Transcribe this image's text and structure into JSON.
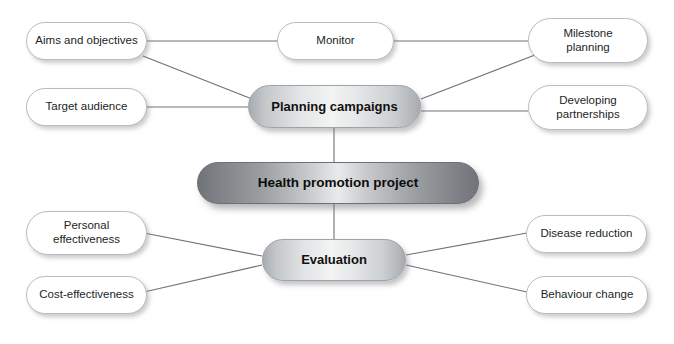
{
  "diagram": {
    "type": "mind-map",
    "background_color": "#ffffff",
    "line_color": "#6e7276",
    "center": {
      "id": "health-promotion-project",
      "label": "Health promotion project",
      "x": 197,
      "y": 162,
      "w": 282,
      "h": 42,
      "style": "center"
    },
    "branches": [
      {
        "id": "planning-campaigns",
        "label": "Planning campaigns",
        "x": 248,
        "y": 85,
        "w": 173,
        "h": 43,
        "style": "mid"
      },
      {
        "id": "evaluation",
        "label": "Evaluation",
        "x": 262,
        "y": 239,
        "w": 144,
        "h": 42,
        "style": "mid"
      }
    ],
    "leaves": [
      {
        "id": "aims-and-objectives",
        "label": "Aims and objectives",
        "lines": [
          "Aims and objectives"
        ],
        "x": 26,
        "y": 22,
        "w": 121,
        "h": 38,
        "parent": "planning-campaigns"
      },
      {
        "id": "monitor",
        "label": "Monitor",
        "lines": [
          "Monitor"
        ],
        "x": 277,
        "y": 22,
        "w": 117,
        "h": 38,
        "parent": "planning-campaigns"
      },
      {
        "id": "milestone-planning",
        "label": "Milestone planning",
        "lines": [
          "Milestone",
          "planning"
        ],
        "x": 528,
        "y": 18,
        "w": 120,
        "h": 45,
        "parent": "planning-campaigns"
      },
      {
        "id": "target-audience",
        "label": "Target audience",
        "lines": [
          "Target audience"
        ],
        "x": 26,
        "y": 88,
        "w": 121,
        "h": 38,
        "parent": "planning-campaigns"
      },
      {
        "id": "developing-partnerships",
        "label": "Developing partnerships",
        "lines": [
          "Developing",
          "partnerships"
        ],
        "x": 528,
        "y": 85,
        "w": 120,
        "h": 45,
        "parent": "planning-campaigns"
      },
      {
        "id": "personal-effectiveness",
        "label": "Personal effectiveness",
        "lines": [
          "Personal",
          "effectiveness"
        ],
        "x": 26,
        "y": 211,
        "w": 121,
        "h": 44,
        "parent": "evaluation"
      },
      {
        "id": "disease-reduction",
        "label": "Disease reduction",
        "lines": [
          "Disease reduction"
        ],
        "x": 526,
        "y": 215,
        "w": 121,
        "h": 38,
        "parent": "evaluation"
      },
      {
        "id": "cost-effectiveness",
        "label": "Cost-effectiveness",
        "lines": [
          "Cost-effectiveness"
        ],
        "x": 26,
        "y": 276,
        "w": 121,
        "h": 38,
        "parent": "evaluation"
      },
      {
        "id": "behaviour-change",
        "label": "Behaviour change",
        "lines": [
          "Behaviour change"
        ],
        "x": 526,
        "y": 276,
        "w": 122,
        "h": 38,
        "parent": "evaluation"
      }
    ],
    "connectors": [
      {
        "id": "link-center-planning",
        "from": "health-promotion-project",
        "to": "planning-campaigns",
        "x1": 334,
        "y1": 162,
        "x2": 334,
        "y2": 128
      },
      {
        "id": "link-center-evaluation",
        "from": "health-promotion-project",
        "to": "evaluation",
        "x1": 334,
        "y1": 204,
        "x2": 334,
        "y2": 239
      },
      {
        "id": "link-planning-aims",
        "from": "planning-campaigns",
        "to": "aims-and-objectives",
        "x1": 252,
        "y1": 99,
        "x2": 143,
        "y2": 56
      },
      {
        "id": "link-planning-monitor",
        "from": "planning-campaigns",
        "to": "monitor",
        "x1": 147,
        "y1": 41,
        "x2": 277,
        "y2": 41
      },
      {
        "id": "link-monitor-milestone",
        "from": "monitor",
        "to": "milestone-planning",
        "x1": 394,
        "y1": 41,
        "x2": 528,
        "y2": 41
      },
      {
        "id": "link-planning-milestone",
        "from": "planning-campaigns",
        "to": "milestone-planning",
        "x1": 421,
        "y1": 99,
        "x2": 535,
        "y2": 55
      },
      {
        "id": "link-planning-target",
        "from": "planning-campaigns",
        "to": "target-audience",
        "x1": 147,
        "y1": 107,
        "x2": 248,
        "y2": 107
      },
      {
        "id": "link-planning-partnerships",
        "from": "planning-campaigns",
        "to": "developing-partnerships",
        "x1": 421,
        "y1": 111,
        "x2": 528,
        "y2": 111
      },
      {
        "id": "link-evaluation-personal",
        "from": "evaluation",
        "to": "personal-effectiveness",
        "x1": 262,
        "y1": 256,
        "x2": 144,
        "y2": 233
      },
      {
        "id": "link-evaluation-cost",
        "from": "evaluation",
        "to": "cost-effectiveness",
        "x1": 262,
        "y1": 265,
        "x2": 144,
        "y2": 292
      },
      {
        "id": "link-evaluation-disease",
        "from": "evaluation",
        "to": "disease-reduction",
        "x1": 406,
        "y1": 255,
        "x2": 527,
        "y2": 233
      },
      {
        "id": "link-evaluation-behaviour",
        "from": "evaluation",
        "to": "behaviour-change",
        "x1": 406,
        "y1": 265,
        "x2": 527,
        "y2": 292
      }
    ]
  }
}
